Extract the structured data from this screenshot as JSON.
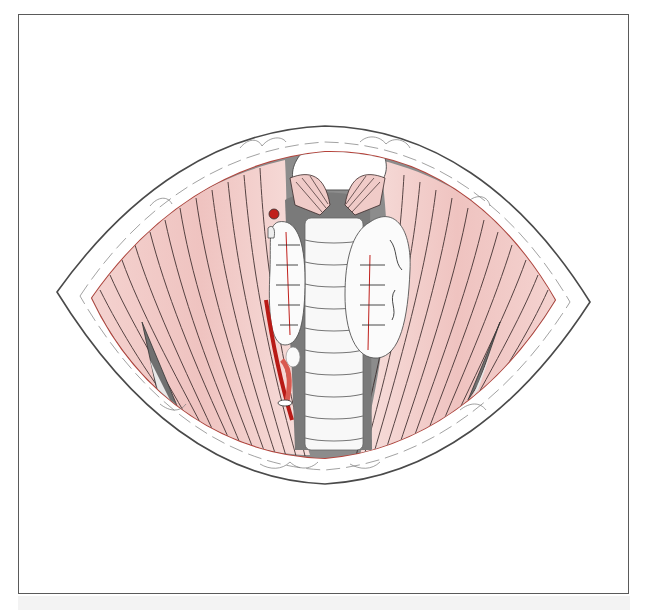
{
  "figure": {
    "type": "anatomical-illustration",
    "structures": [
      {
        "name": "skin-incision-margin",
        "label": ""
      },
      {
        "name": "left-strap-muscles",
        "label": ""
      },
      {
        "name": "right-strap-muscles",
        "label": ""
      },
      {
        "name": "thyroid-cartilage-cricothyroid",
        "label": ""
      },
      {
        "name": "trachea",
        "label": ""
      },
      {
        "name": "left-thyroid-lobe",
        "label": ""
      },
      {
        "name": "right-thyroid-lobe",
        "label": ""
      },
      {
        "name": "carotid-vessel",
        "label": ""
      },
      {
        "name": "parathyroid-gland",
        "label": ""
      }
    ],
    "colors": {
      "muscle": "#f2c9c6",
      "muscle_dark": "#e3a8a4",
      "fiber_line": "#3a2a2a",
      "vessel": "#c0201c",
      "cavity_gray": "#9a9a9a",
      "outline": "#4a4a4a",
      "frame": "#5a5a5a"
    }
  }
}
